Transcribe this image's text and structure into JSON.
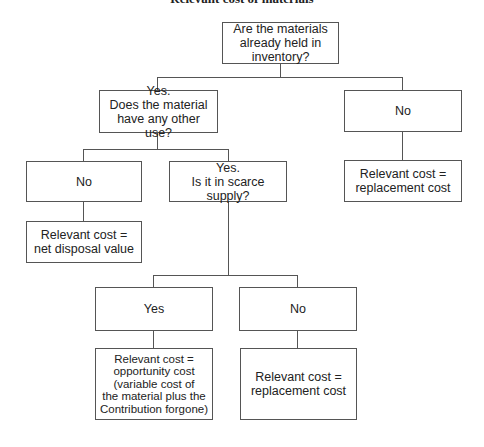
{
  "title": "Relevant cost of materials",
  "nodes": {
    "root": "Are the materials already held in inventory?",
    "yes_other_use": "Yes.\nDoes the material have any other use?",
    "no_inventory": "No",
    "replacement_result_1": "Relevant cost =\nreplacement cost",
    "no_other_use": "No",
    "disposal_result": "Relevant cost =\nnet disposal value",
    "yes_scarce": "Yes.\nIs it in scarce supply?",
    "scarce_yes": "Yes",
    "scarce_no": "No",
    "opportunity_result": "Relevant cost =\nopportunity cost\n(variable cost of\nthe material plus the\nContribution forgone)",
    "replacement_result_2": "Relevant cost =\nreplacement cost"
  },
  "colors": {
    "line": "#555555",
    "text": "#222222"
  }
}
